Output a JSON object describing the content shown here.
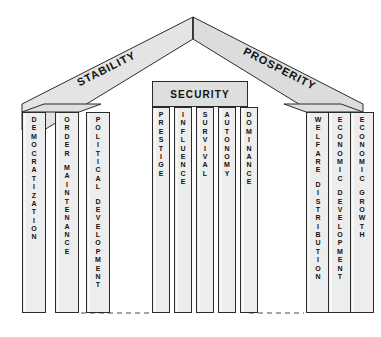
{
  "diagram": {
    "roof": {
      "left_label": "STABILITY",
      "right_label": "PROSPERITY"
    },
    "lintel": {
      "label": "SECURITY"
    },
    "groups": [
      {
        "name": "stability-group",
        "pillars": [
          {
            "label": "DEMOCRATIZATION"
          },
          {
            "label": "ORDER MAINTENANCE"
          },
          {
            "label": "POLITICAL DEVELOPMENT"
          }
        ]
      },
      {
        "name": "security-group",
        "pillars": [
          {
            "label": "PRESTIGE"
          },
          {
            "label": "INFLUENCE"
          },
          {
            "label": "SURVIVAL"
          },
          {
            "label": "AUTONOMY"
          },
          {
            "label": "DOMINANCE"
          }
        ]
      },
      {
        "name": "prosperity-group",
        "pillars": [
          {
            "label": "WELFARE DISTRIBUTION"
          },
          {
            "label": "ECONOMIC DEVELOPMENT"
          },
          {
            "label": "ECONOMIC GROWTH"
          }
        ]
      }
    ],
    "colors": {
      "outline": "#2b2b2b",
      "roof_fill": "#e4e4e4",
      "pillar_fill": "#ededed",
      "lintel_fill": "#dedede",
      "text": "#111111",
      "background": "#ffffff"
    }
  }
}
